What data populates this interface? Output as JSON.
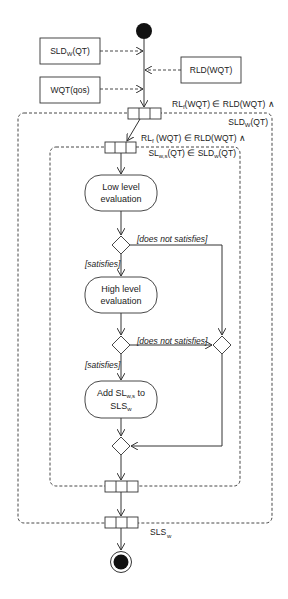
{
  "diagram": {
    "type": "UML activity diagram",
    "inputs": {
      "sld": {
        "base": "SLD",
        "sub": "W",
        "tail": "(QT)"
      },
      "wqt": {
        "text": "WQT(qos)"
      },
      "rld": {
        "text": "RLD(WQT)"
      }
    },
    "outer_region": {
      "guard_line1": {
        "base": "RL",
        "sub": "f",
        "tail": "(WQT) ∈ RLD(WQT) ∧"
      },
      "guard_line2": {
        "base": "SLD",
        "sub": "W",
        "tail": "(QT)"
      }
    },
    "inner_region": {
      "guard_line1": {
        "base": "RL",
        "sub": "f",
        "tail": " (WQT) ∈ RLD(WQT) ∧"
      },
      "guard_line2": {
        "base": "SL",
        "sub": "w,s",
        "mid": "(QT) ∈ SLD",
        "sub2": "w",
        "tail": "(QT)"
      }
    },
    "activities": {
      "low": {
        "line1": "Low level",
        "line2": "evaluation"
      },
      "high": {
        "line1": "High level",
        "line2": "evaluation"
      },
      "add": {
        "pre": "Add SL",
        "sub": "w,s",
        "post": " to",
        "line2": "SLS",
        "sub2": "w"
      }
    },
    "guards": {
      "satisfies": "[satisfies]",
      "not_satisfies": "[does not satisfies]"
    },
    "output": {
      "base": "SLS",
      "sub": "w"
    },
    "colors": {
      "stroke": "#333333",
      "fill": "#111111",
      "background": "#ffffff"
    }
  }
}
